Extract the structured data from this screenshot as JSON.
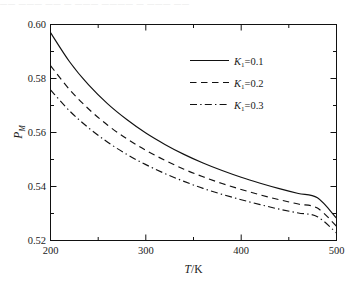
{
  "figure": {
    "top_partial_text": "—— ——— —— — ——— ———— — ——— ——"
  },
  "axes": {
    "y_title_main": "P",
    "y_title_sub": "M",
    "x_title_main": "T",
    "x_title_unit": "/K"
  },
  "legend": {
    "items": [
      {
        "var": "K",
        "sub": "1",
        "eq": "=0.1",
        "style": "solid",
        "label": "K₁=0.1"
      },
      {
        "var": "K",
        "sub": "1",
        "eq": "=0.2",
        "style": "dashed",
        "label": "K₁=0.2"
      },
      {
        "var": "K",
        "sub": "1",
        "eq": "=0.3",
        "style": "dashdot",
        "label": "K₁=0.3"
      }
    ]
  },
  "chart_data": {
    "type": "line",
    "title": "",
    "subtitle": "",
    "xlabel": "T/K",
    "ylabel": "P_M",
    "xlim": [
      200,
      500
    ],
    "ylim": [
      0.52,
      0.6
    ],
    "xticks": [
      200,
      300,
      400,
      500
    ],
    "xticks_minor": [
      250,
      350,
      450
    ],
    "xtick_labels": [
      "200",
      "300",
      "400",
      "500"
    ],
    "yticks": [
      0.52,
      0.54,
      0.56,
      0.58,
      0.6
    ],
    "yticks_minor": [
      0.53,
      0.55,
      0.57,
      0.59
    ],
    "ytick_labels": [
      "0.52",
      "0.54",
      "0.56",
      "0.58",
      "0.60"
    ],
    "grid": false,
    "legend_position": "upper right",
    "x": [
      200,
      220,
      240,
      260,
      280,
      300,
      320,
      340,
      360,
      380,
      400,
      420,
      440,
      460,
      480,
      500
    ],
    "series": [
      {
        "name": "K₁=0.1",
        "style": "solid",
        "values": [
          0.597,
          0.5862,
          0.5776,
          0.5706,
          0.5648,
          0.5598,
          0.5556,
          0.5519,
          0.5487,
          0.5459,
          0.5434,
          0.5412,
          0.5392,
          0.5374,
          0.5358,
          0.5283
        ]
      },
      {
        "name": "K₁=0.2",
        "style": "dashed",
        "values": [
          0.5848,
          0.5759,
          0.5687,
          0.5627,
          0.5577,
          0.5534,
          0.5497,
          0.5464,
          0.5436,
          0.5411,
          0.5389,
          0.5369,
          0.5351,
          0.5335,
          0.532,
          0.5253
        ]
      },
      {
        "name": "K₁=0.3",
        "style": "dashdot",
        "values": [
          0.5758,
          0.568,
          0.5617,
          0.5564,
          0.5519,
          0.5481,
          0.5448,
          0.5419,
          0.5393,
          0.5371,
          0.5351,
          0.5333,
          0.5316,
          0.5302,
          0.5288,
          0.5228
        ]
      }
    ]
  }
}
